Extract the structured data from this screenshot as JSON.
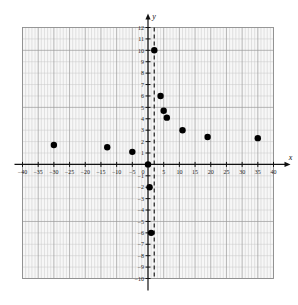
{
  "chart_data": {
    "type": "scatter",
    "title": "",
    "subtitle": "",
    "xlabel": "x",
    "ylabel": "y",
    "xlim": [
      -40,
      40
    ],
    "ylim": [
      -10,
      12
    ],
    "x_major_ticks": [
      -40,
      -35,
      -30,
      -25,
      -20,
      -15,
      -10,
      -5,
      5,
      10,
      15,
      20,
      25,
      30,
      35,
      40
    ],
    "x_tick_labels": [
      "−40",
      "−35",
      "−30",
      "−25",
      "−20",
      "−15",
      "−10",
      "−5",
      "5",
      "10",
      "15",
      "20",
      "25",
      "30",
      "35",
      "40"
    ],
    "y_major_ticks": [
      -10,
      -9,
      -8,
      -7,
      -6,
      -5,
      -4,
      -3,
      -2,
      -1,
      1,
      2,
      3,
      4,
      5,
      6,
      7,
      8,
      9,
      10,
      11,
      12
    ],
    "y_tick_labels": [
      "−10",
      "−9",
      "−8",
      "−7",
      "−6",
      "−5",
      "−4",
      "−3",
      "−2",
      "−1",
      "1",
      "2",
      "3",
      "4",
      "5",
      "6",
      "7",
      "8",
      "9",
      "10",
      "11",
      "12"
    ],
    "origin_label": "0",
    "grid": true,
    "grid_minor_step_x": 1,
    "grid_major_step_x": 5,
    "grid_minor_step_y": 1,
    "grid_major_step_y": 5,
    "legend": null,
    "legend_position": "none",
    "point_color": "#000000",
    "point_radius": 3.2,
    "points": [
      {
        "x": -30,
        "y": 1.7
      },
      {
        "x": -13,
        "y": 1.5
      },
      {
        "x": -5,
        "y": 1.1
      },
      {
        "x": 0,
        "y": 0
      },
      {
        "x": 0.5,
        "y": -2
      },
      {
        "x": 1,
        "y": -6
      },
      {
        "x": 2,
        "y": 10
      },
      {
        "x": 4,
        "y": 6
      },
      {
        "x": 5,
        "y": 4.7
      },
      {
        "x": 6,
        "y": 4.1
      },
      {
        "x": 11,
        "y": 3
      },
      {
        "x": 19,
        "y": 2.4
      },
      {
        "x": 35,
        "y": 2.3
      }
    ],
    "annotations": [
      {
        "name": "vertical-asymptote",
        "type": "vline",
        "x": 2,
        "style": "dashed",
        "color": "#3a3a3a",
        "label": ""
      }
    ],
    "colors": {
      "background": "#ffffff",
      "plot_background": "#f7f7f7",
      "grid_minor": "#c9c9c9",
      "grid_major": "#9a9a9a",
      "axis": "#111111",
      "border": "#8f8f8f"
    }
  }
}
